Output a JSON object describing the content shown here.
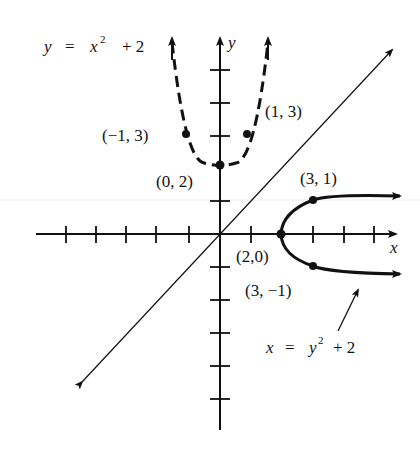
{
  "figure": {
    "axes": {
      "x_label": "x",
      "y_label": "y",
      "x_ticks": [
        -5,
        -4,
        -3,
        -2,
        -1,
        1,
        2,
        3,
        4,
        5
      ],
      "y_ticks": [
        -6,
        -5,
        -4,
        -3,
        -2,
        -1,
        1,
        2,
        3,
        4,
        5
      ]
    },
    "curves": {
      "parabola_up": {
        "label": "y = x² + 2",
        "eq_lhs": "y",
        "eq_eq": "=",
        "eq_var": "x",
        "eq_exp": "2",
        "eq_rest": "+ 2",
        "style": "dashed"
      },
      "parabola_right": {
        "label": "x = y² + 2",
        "eq_lhs": "x",
        "eq_eq": "=",
        "eq_var": "y",
        "eq_exp": "2",
        "eq_rest": "+ 2",
        "style": "solid"
      },
      "line": {
        "label": "y = x",
        "style": "thin solid"
      }
    },
    "points": [
      {
        "name": "vertex-up",
        "label": "(0, 2)",
        "x": 0,
        "y": 2
      },
      {
        "name": "point-neg1-3",
        "label": "(−1, 3)",
        "x": -1,
        "y": 3
      },
      {
        "name": "point-1-3",
        "label": "(1, 3)",
        "x": 1,
        "y": 3
      },
      {
        "name": "vertex-right",
        "label": "(2,0)",
        "x": 2,
        "y": 0
      },
      {
        "name": "point-3-1",
        "label": "(3, 1)",
        "x": 3,
        "y": 1
      },
      {
        "name": "point-3-neg1",
        "label": "(3, −1)",
        "x": 3,
        "y": -1
      }
    ]
  }
}
